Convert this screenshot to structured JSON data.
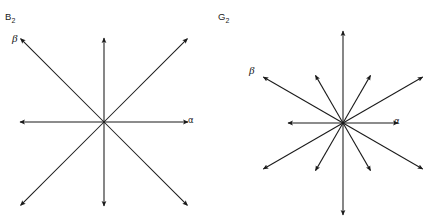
{
  "figure": {
    "width": 427,
    "height": 218,
    "background": "#ffffff",
    "line_color": "#1a1a1a"
  },
  "panels": [
    {
      "id": "b2",
      "title_base": "B",
      "title_sub": "2",
      "center": [
        104,
        122
      ],
      "alpha_label": "α",
      "beta_label": "β"
    },
    {
      "id": "g2",
      "title_base": "G",
      "title_sub": "2",
      "center": [
        129,
        123
      ],
      "alpha_label": "α",
      "beta_label": "β"
    }
  ],
  "chart_data": {
    "type": "scatter",
    "xlabel": "",
    "ylabel": "",
    "diagrams": [
      {
        "name": "B2",
        "label": "B₂",
        "center_px": [
          104,
          122
        ],
        "root_count": 8,
        "simple_roots": {
          "alpha": 0,
          "beta": 135
        },
        "roots": [
          {
            "angle_deg": 0,
            "length_px": 84,
            "kind": "short",
            "label": "α"
          },
          {
            "angle_deg": 45,
            "length_px": 118,
            "kind": "long",
            "label": ""
          },
          {
            "angle_deg": 90,
            "length_px": 84,
            "kind": "short",
            "label": ""
          },
          {
            "angle_deg": 135,
            "length_px": 118,
            "kind": "long",
            "label": "β"
          },
          {
            "angle_deg": 180,
            "length_px": 84,
            "kind": "short",
            "label": ""
          },
          {
            "angle_deg": 225,
            "length_px": 118,
            "kind": "long",
            "label": ""
          },
          {
            "angle_deg": 270,
            "length_px": 84,
            "kind": "short",
            "label": ""
          },
          {
            "angle_deg": 315,
            "length_px": 118,
            "kind": "long",
            "label": ""
          }
        ]
      },
      {
        "name": "G2",
        "label": "G₂",
        "center_px": [
          343,
          123
        ],
        "root_count": 12,
        "simple_roots": {
          "alpha": 0,
          "beta": 150
        },
        "roots": [
          {
            "angle_deg": 0,
            "length_px": 55,
            "kind": "short",
            "label": "α"
          },
          {
            "angle_deg": 30,
            "length_px": 92,
            "kind": "long",
            "label": ""
          },
          {
            "angle_deg": 60,
            "length_px": 55,
            "kind": "short",
            "label": ""
          },
          {
            "angle_deg": 90,
            "length_px": 92,
            "kind": "long",
            "label": ""
          },
          {
            "angle_deg": 120,
            "length_px": 55,
            "kind": "short",
            "label": ""
          },
          {
            "angle_deg": 150,
            "length_px": 92,
            "kind": "long",
            "label": "β"
          },
          {
            "angle_deg": 180,
            "length_px": 55,
            "kind": "short",
            "label": ""
          },
          {
            "angle_deg": 210,
            "length_px": 92,
            "kind": "long",
            "label": ""
          },
          {
            "angle_deg": 240,
            "length_px": 55,
            "kind": "short",
            "label": ""
          },
          {
            "angle_deg": 270,
            "length_px": 92,
            "kind": "long",
            "label": ""
          },
          {
            "angle_deg": 300,
            "length_px": 55,
            "kind": "short",
            "label": ""
          },
          {
            "angle_deg": 330,
            "length_px": 92,
            "kind": "long",
            "label": ""
          }
        ]
      }
    ]
  }
}
